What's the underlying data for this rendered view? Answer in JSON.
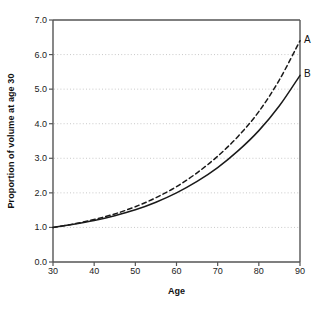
{
  "chart_data": {
    "type": "line",
    "title": "",
    "xlabel": "Age",
    "ylabel": "Proportion of volume at age 30",
    "xlim": [
      30,
      90
    ],
    "ylim": [
      0.0,
      7.0
    ],
    "xticks": [
      "30",
      "40",
      "50",
      "60",
      "70",
      "80",
      "90"
    ],
    "yticks": [
      "0.0",
      "1.0",
      "2.0",
      "3.0",
      "4.0",
      "5.0",
      "6.0",
      "7.0"
    ],
    "grid": "horizontal-dotted",
    "legend": "inline-end-labels",
    "x": [
      30,
      35,
      40,
      45,
      50,
      55,
      60,
      65,
      70,
      75,
      80,
      85,
      90
    ],
    "series": [
      {
        "name": "A",
        "label": "A",
        "style": "dashed",
        "color": "#1a1a1a",
        "end_label_value": 6.4,
        "values": [
          1.0,
          1.1,
          1.23,
          1.39,
          1.6,
          1.86,
          2.18,
          2.58,
          3.06,
          3.64,
          4.35,
          5.27,
          6.4
        ]
      },
      {
        "name": "B",
        "label": "B",
        "style": "solid",
        "color": "#1a1a1a",
        "end_label_value": 5.4,
        "values": [
          1.0,
          1.09,
          1.2,
          1.34,
          1.51,
          1.73,
          2.0,
          2.33,
          2.73,
          3.22,
          3.8,
          4.52,
          5.4
        ]
      }
    ]
  },
  "axes": {
    "plot_left": 53,
    "plot_right": 300,
    "plot_top": 20,
    "plot_bottom": 262
  },
  "colors": {
    "axis": "#555555",
    "grid": "#bbbbbb",
    "curve": "#1a1a1a",
    "text": "#111111",
    "background": "#ffffff"
  }
}
